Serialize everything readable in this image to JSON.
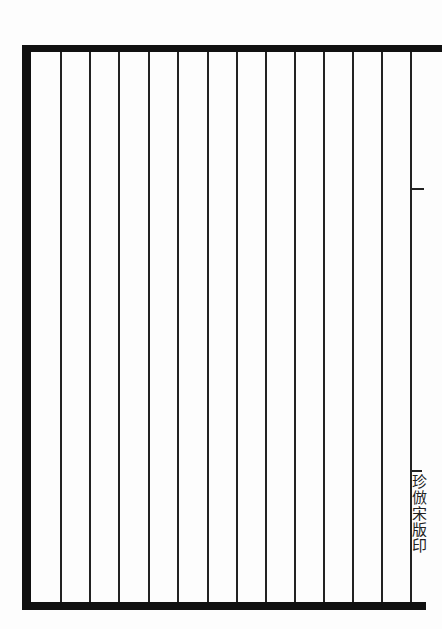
{
  "page": {
    "type": "ruled-blank-page",
    "column_count": 12,
    "rule_positions_x": [
      60,
      89,
      118,
      148,
      177,
      207,
      236,
      265,
      294,
      323,
      352,
      381,
      410
    ],
    "colors": {
      "ink": "#111111",
      "paper": "#fdfdfd"
    }
  },
  "fold_center": {
    "mark": "一",
    "imprint": "珍倣宋版印"
  }
}
